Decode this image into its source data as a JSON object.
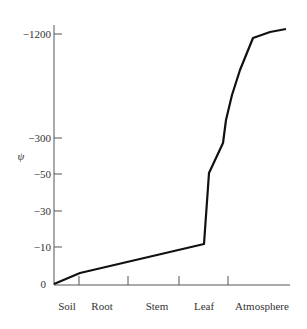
{
  "chart_data": {
    "type": "line",
    "title": "",
    "xlabel": "",
    "ylabel": "ψ",
    "categories": [
      "Soil",
      "Root",
      "Stem",
      "Leaf",
      "Atmosphere"
    ],
    "y_ticks": [
      "0",
      "−10",
      "−30",
      "−50",
      "−300",
      "−1200"
    ],
    "y_scale": "non-linear (compressed)",
    "series": [
      {
        "name": "Water potential",
        "points": [
          {
            "x": "Soil",
            "y": 0
          },
          {
            "x": "Soil/Root boundary",
            "y": -3
          },
          {
            "x": "Leaf (before boundary)",
            "y": -11
          },
          {
            "x": "Leaf",
            "y": -50
          },
          {
            "x": "Leaf/Atmosphere",
            "y": -280
          },
          {
            "x": "Atmosphere",
            "y": -1200
          },
          {
            "x": "Atmosphere end",
            "y": -1250
          }
        ]
      }
    ],
    "grid": false,
    "legend": "none"
  },
  "axis": {
    "y_label": "ψ",
    "y_ticks": [
      {
        "label": "−1200",
        "y": 34
      },
      {
        "label": "−300",
        "y": 138
      },
      {
        "label": "−50",
        "y": 174
      },
      {
        "label": "−30",
        "y": 211
      },
      {
        "label": "−10",
        "y": 247
      },
      {
        "label": "0",
        "y": 284
      }
    ],
    "x_labels": [
      {
        "label": "Soil",
        "x": 67
      },
      {
        "label": "Root",
        "x": 102
      },
      {
        "label": "Stem",
        "x": 157
      },
      {
        "label": "Leaf",
        "x": 204
      },
      {
        "label": "Atmosphere",
        "x": 262
      }
    ],
    "x_ticks": [
      79,
      128,
      179,
      228
    ]
  },
  "curve": {
    "points": "54,284 80,273 204,244 209,173 223,143 226,120 232,95 240,70 253,38 270,32 286,29",
    "color": "#111111"
  }
}
